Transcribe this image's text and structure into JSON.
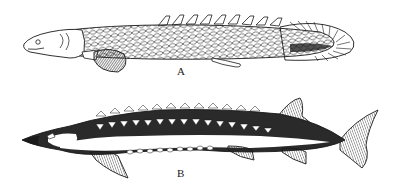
{
  "figure": {
    "panels": [
      {
        "label": "A",
        "subject": "bichir"
      },
      {
        "label": "B",
        "subject": "sturgeon"
      }
    ],
    "colors": {
      "ink": "#1a1a1a",
      "paper": "#ffffff"
    }
  }
}
